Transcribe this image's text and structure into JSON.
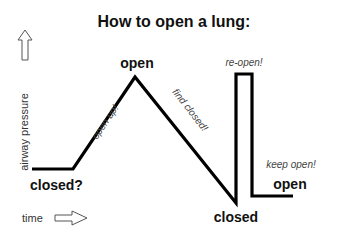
{
  "title": "How to open a lung:",
  "axes": {
    "y_label": "airway pressure",
    "x_label": "time"
  },
  "states": {
    "start": "closed?",
    "peak": "open",
    "trough": "closed",
    "end": "open"
  },
  "annotations": {
    "rise": "open up!",
    "fall": "find closed!",
    "pulse": "re-open!",
    "hold": "keep open!"
  },
  "colors": {
    "line": "#000000",
    "text": "#111111",
    "note": "#444444"
  }
}
